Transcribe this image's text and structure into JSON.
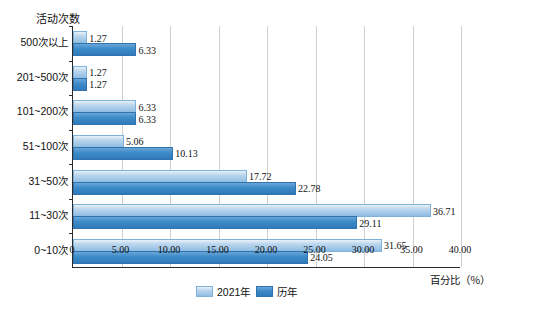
{
  "chart_data": {
    "type": "bar",
    "orientation": "horizontal",
    "title": "",
    "xlabel": "百分比（％）",
    "ylabel": "活动次数",
    "xlim": [
      0,
      40
    ],
    "xticks": [
      "0",
      "5.00",
      "10.00",
      "15.00",
      "20.00",
      "25.00",
      "30.00",
      "35.00",
      "40.00"
    ],
    "grid": true,
    "legend_position": "bottom-center",
    "categories": [
      "0~10次",
      "11~30次",
      "31~50次",
      "51~100次",
      "101~200次",
      "201~500次",
      "500次以上"
    ],
    "series": [
      {
        "name": "2021年",
        "color": "#bcd7ee",
        "values": [
          31.65,
          36.71,
          17.72,
          5.06,
          6.33,
          1.27,
          1.27
        ]
      },
      {
        "name": "历年",
        "color": "#3f8ccb",
        "values": [
          24.05,
          29.11,
          22.78,
          10.13,
          6.33,
          1.27,
          6.33
        ]
      }
    ]
  }
}
